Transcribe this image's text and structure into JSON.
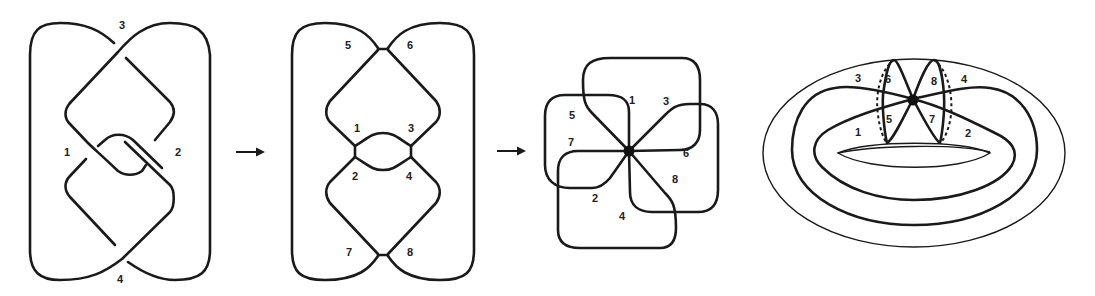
{
  "figure": {
    "colors": {
      "stroke": "#1a1a1a",
      "background": "#ffffff"
    },
    "panels": [
      {
        "id": "knot-diagram",
        "labels": {
          "c1": "1",
          "c2": "2",
          "c3": "3",
          "c4": "4"
        }
      },
      {
        "id": "ribbon-graph",
        "labels": {
          "r1": "1",
          "r2": "2",
          "r3": "3",
          "r4": "4",
          "r5": "5",
          "r6": "6",
          "r7": "7",
          "r8": "8"
        }
      },
      {
        "id": "bouquet",
        "labels": {
          "b1": "1",
          "b2": "2",
          "b3": "3",
          "b4": "4",
          "b5": "5",
          "b6": "6",
          "b7": "7",
          "b8": "8"
        }
      },
      {
        "id": "torus-embedding",
        "labels": {
          "t1": "1",
          "t2": "2",
          "t3": "3",
          "t4": "4",
          "t5": "5",
          "t6": "6",
          "t7": "7",
          "t8": "8"
        }
      }
    ],
    "arrows": [
      {
        "id": "arrow-1",
        "icon": "right-arrow-icon"
      },
      {
        "id": "arrow-2",
        "icon": "right-arrow-icon"
      }
    ]
  }
}
